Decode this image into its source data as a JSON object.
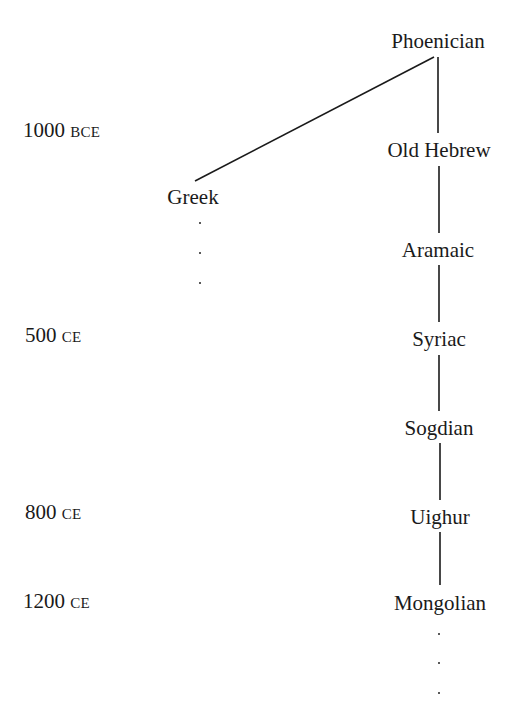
{
  "diagram": {
    "type": "script-lineage-tree",
    "timeline": [
      {
        "year": "1000",
        "era": "BCE"
      },
      {
        "year": "500",
        "era": "CE"
      },
      {
        "year": "800",
        "era": "CE"
      },
      {
        "year": "1200",
        "era": "CE"
      }
    ],
    "nodes": [
      {
        "id": "phoenician",
        "label": "Phoenician"
      },
      {
        "id": "old-hebrew",
        "label": "Old Hebrew"
      },
      {
        "id": "greek",
        "label": "Greek"
      },
      {
        "id": "aramaic",
        "label": "Aramaic"
      },
      {
        "id": "syriac",
        "label": "Syriac"
      },
      {
        "id": "sogdian",
        "label": "Sogdian"
      },
      {
        "id": "uighur",
        "label": "Uighur"
      },
      {
        "id": "mongolian",
        "label": "Mongolian"
      }
    ],
    "edges": [
      [
        "phoenician",
        "greek"
      ],
      [
        "phoenician",
        "old-hebrew"
      ],
      [
        "old-hebrew",
        "aramaic"
      ],
      [
        "aramaic",
        "syriac"
      ],
      [
        "syriac",
        "sogdian"
      ],
      [
        "sogdian",
        "uighur"
      ],
      [
        "uighur",
        "mongolian"
      ]
    ],
    "continuations": [
      "greek",
      "mongolian"
    ],
    "continuation_marker": "⋮"
  }
}
